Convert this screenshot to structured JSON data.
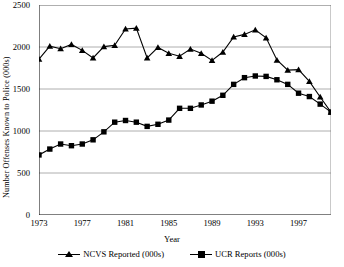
{
  "chart_data": {
    "type": "line",
    "title": "",
    "xlabel": "Year",
    "ylabel": "Number Offenses Known to Police (000s)",
    "xlim": [
      1973,
      2000
    ],
    "ylim": [
      0,
      2500
    ],
    "ytick_labels": [
      "0",
      "500",
      "1000",
      "1500",
      "2000",
      "2500"
    ],
    "ytick_values": [
      0,
      500,
      1000,
      1500,
      2000,
      2500
    ],
    "xtick_labels": [
      "1973",
      "1977",
      "1981",
      "1985",
      "1989",
      "1993",
      "1997"
    ],
    "xtick_values": [
      1973,
      1977,
      1981,
      1985,
      1989,
      1993,
      1997
    ],
    "grid": "horizontal",
    "legend_position": "bottom",
    "x": [
      1973,
      1974,
      1975,
      1976,
      1977,
      1978,
      1979,
      1980,
      1981,
      1982,
      1983,
      1984,
      1985,
      1986,
      1987,
      1988,
      1989,
      1990,
      1991,
      1992,
      1993,
      1994,
      1995,
      1996,
      1997,
      1998,
      1999,
      2000
    ],
    "series": [
      {
        "name": "NCVS Reported (000s)",
        "marker": "triangle",
        "color": "#000000",
        "values": [
          1855,
          2010,
          1980,
          2030,
          1960,
          1870,
          2005,
          2020,
          2215,
          2225,
          1870,
          1995,
          1925,
          1890,
          1975,
          1925,
          1840,
          1940,
          2120,
          2150,
          2205,
          2110,
          1845,
          1725,
          1730,
          1590,
          1405,
          1225
        ]
      },
      {
        "name": "UCR Reports (000s)",
        "marker": "square",
        "color": "#000000",
        "values": [
          715,
          785,
          845,
          825,
          845,
          895,
          990,
          1105,
          1125,
          1105,
          1055,
          1080,
          1130,
          1270,
          1270,
          1310,
          1355,
          1425,
          1555,
          1635,
          1655,
          1650,
          1610,
          1555,
          1450,
          1410,
          1320,
          1225
        ]
      }
    ]
  },
  "axis": {
    "y_title": "Number Offenses Known to Police (000s)",
    "x_title": "Year"
  }
}
